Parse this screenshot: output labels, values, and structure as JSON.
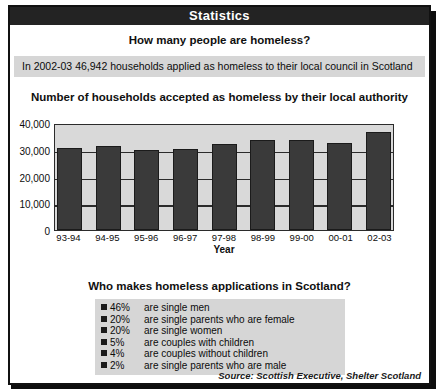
{
  "header": {
    "title": "Statistics"
  },
  "question1": "How many people are homeless?",
  "fact": "In 2002-03 46,942 households applied as homeless to their local council in Scotland",
  "question2": "Who makes homeless applications in Scotland?",
  "source": "Source: Scottish Executive, Shelter Scotland",
  "chart_data": {
    "type": "bar",
    "title": "Number of households accepted as homeless by their local authority",
    "xlabel": "Year",
    "ylabel": "",
    "categories": [
      "93-94",
      "94-95",
      "95-96",
      "96-97",
      "97-98",
      "98-99",
      "99-00",
      "00-01",
      "02-03"
    ],
    "values": [
      30700,
      31300,
      30000,
      30200,
      32000,
      33800,
      33600,
      32600,
      36500
    ],
    "ylim": [
      0,
      40000
    ],
    "yticks": [
      0,
      10000,
      20000,
      30000,
      40000
    ],
    "ytick_labels": [
      "0",
      "10,000",
      "20,000",
      "30,000",
      "40,000"
    ],
    "grid": true,
    "legend": "none",
    "bar_color": "#3a3a3a",
    "plot_background": "#d9d9d9"
  },
  "applications": {
    "rows": [
      {
        "percent": "46%",
        "description": "are single men"
      },
      {
        "percent": "20%",
        "description": "are single parents who are female"
      },
      {
        "percent": "20%",
        "description": "are single women"
      },
      {
        "percent": "5%",
        "description": "are couples with children"
      },
      {
        "percent": "4%",
        "description": "are couples without children"
      },
      {
        "percent": "2%",
        "description": "are single parents who are male"
      }
    ]
  }
}
